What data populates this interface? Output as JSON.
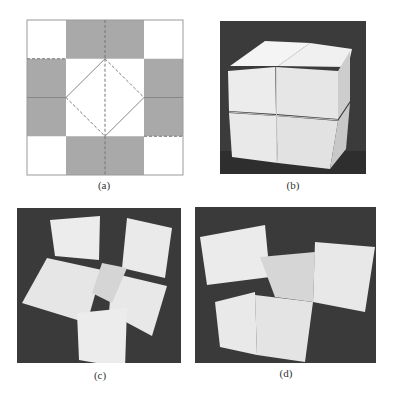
{
  "figure": {
    "panels": [
      {
        "id": "a",
        "label": "(a)",
        "kind": "crease-pattern-diagram",
        "grid": {
          "rows": 4,
          "cols": 4,
          "shaded_cells": [
            [
              0,
              1
            ],
            [
              0,
              2
            ],
            [
              1,
              0
            ],
            [
              1,
              3
            ],
            [
              2,
              0
            ],
            [
              2,
              3
            ],
            [
              3,
              1
            ],
            [
              3,
              2
            ]
          ]
        },
        "colors": {
          "shade": "#a9a9a9",
          "line": "#8a8a8a",
          "background": "#ffffff"
        },
        "lines": {
          "solid": "mountain folds",
          "dashed": "valley folds"
        }
      },
      {
        "id": "b",
        "label": "(b)",
        "kind": "photo",
        "subject": "folded cube assembly (closed)"
      },
      {
        "id": "c",
        "label": "(c)",
        "kind": "photo",
        "subject": "cube assembly partially unfolded"
      },
      {
        "id": "d",
        "label": "(d)",
        "kind": "photo",
        "subject": "cube assembly further unfolded"
      }
    ],
    "colors": {
      "photo_bg": "#3a3a3a",
      "cube_face": "#ebebeb",
      "cube_side": "#d2d2d2",
      "cube_top": "#f6f6f6"
    }
  }
}
